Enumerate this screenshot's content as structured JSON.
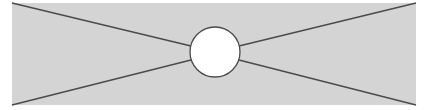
{
  "diagram": {
    "background": "#ffffff",
    "panel": {
      "x": 12,
      "y": 3,
      "width": 404,
      "height": 102,
      "fill": "#d4d4d4"
    },
    "circle": {
      "cx": 215,
      "cy": 52,
      "r": 25,
      "fill": "#ffffff",
      "stroke": "#4a4a4a"
    },
    "line_color": "#4a4a4a",
    "lines": [
      {
        "from": "top-left",
        "x1": 12,
        "y1": 3,
        "x2": 191,
        "y2": 46
      },
      {
        "from": "bottom-left",
        "x1": 12,
        "y1": 105,
        "x2": 191,
        "y2": 60
      },
      {
        "from": "top-right",
        "x1": 416,
        "y1": 3,
        "x2": 239,
        "y2": 46
      },
      {
        "from": "bottom-right",
        "x1": 416,
        "y1": 105,
        "x2": 239,
        "y2": 60
      }
    ]
  }
}
